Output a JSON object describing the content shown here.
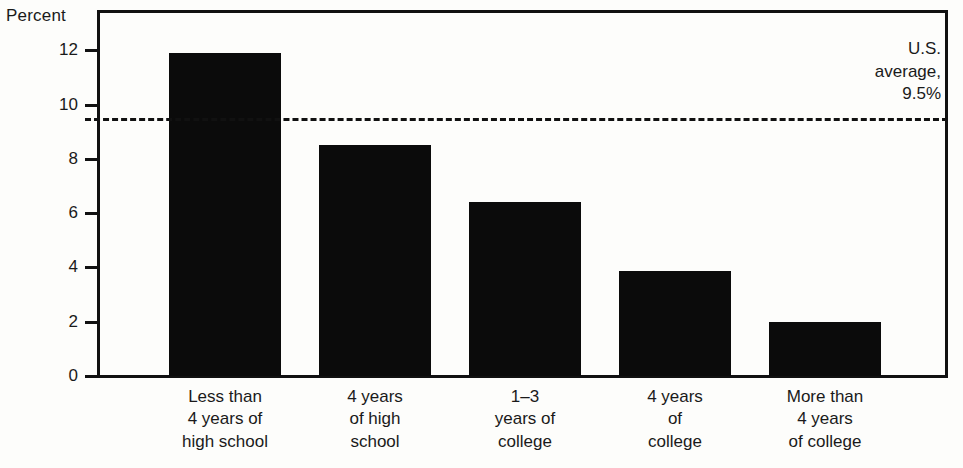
{
  "chart_data": {
    "type": "bar",
    "title": "",
    "ylabel": "Percent",
    "xlabel": "",
    "categories": [
      "Less than\n4 years of\nhigh school",
      "4 years\nof high\nschool",
      "1–3\nyears of\ncollege",
      "4 years\nof\ncollege",
      "More than\n4 years\nof college"
    ],
    "values": [
      11.9,
      8.5,
      6.4,
      3.85,
      2.0
    ],
    "ylim": [
      0,
      13
    ],
    "yticks": [
      0,
      2,
      4,
      6,
      8,
      10,
      12
    ],
    "ytick_labels": [
      "0",
      "2",
      "4",
      "6",
      "8",
      "10",
      "12"
    ],
    "grid": false,
    "legend": "none",
    "annotations": [
      {
        "name": "us-average",
        "text": "U.S.\naverage,\n9.5%",
        "value": 9.5,
        "line_style": "dashed",
        "position": "top-right"
      }
    ],
    "bar_color": "#0b0b0b",
    "axis_color": "#111111"
  },
  "annotation": {
    "text": "U.S.\naverage,\n9.5%"
  }
}
